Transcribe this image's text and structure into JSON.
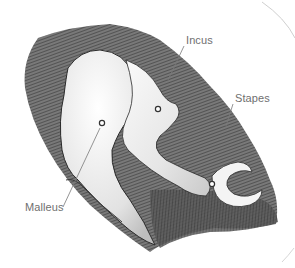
{
  "illustration": {
    "subject": "ossicles-of-middle-ear",
    "style": "pencil-sketch",
    "colors": {
      "background": "#ffffff",
      "label_text": "#6f6f6f",
      "leader_line": "#7a7a7a",
      "shading_dark": "#3a3a3a",
      "shading_mid": "#8a8a8a",
      "bone_fill": "#f2f2f2",
      "outline": "#2a2a2a"
    }
  },
  "labels": {
    "incus": "Incus",
    "stapes": "Stapes",
    "malleus": "Malleus"
  }
}
